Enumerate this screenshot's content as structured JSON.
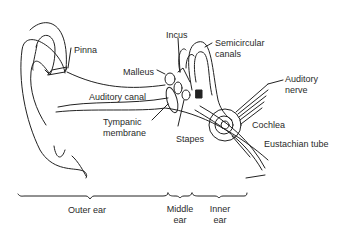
{
  "diagram": {
    "labels": {
      "pinna": "Pinna",
      "incus": "Incus",
      "semicircular_1": "Semicircular",
      "semicircular_2": "canals",
      "malleus": "Malleus",
      "auditory_nerve_1": "Auditory",
      "auditory_nerve_2": "nerve",
      "auditory_canal": "Auditory canal",
      "tympanic_1": "Tympanic",
      "tympanic_2": "membrane",
      "stapes": "Stapes",
      "cochlea": "Cochlea",
      "eustachian_tube": "Eustachian tube"
    },
    "regions": {
      "outer": "Outer ear",
      "middle_1": "Middle",
      "middle_2": "ear",
      "inner_1": "Inner",
      "inner_2": "ear"
    },
    "colors": {
      "line": "#222222",
      "background": "#ffffff"
    }
  }
}
